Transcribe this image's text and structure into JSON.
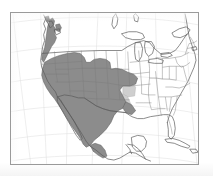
{
  "figure": {
    "background_color": "#ffffff",
    "frame": {
      "stroke_color": "#9a9a9a",
      "stroke_width_px": 1,
      "left_px": 10,
      "top_px": 12,
      "width_px": 189,
      "height_px": 153
    }
  },
  "legend_keys": [
    {
      "key": "primary-range",
      "label": "Primary range",
      "fill_color": "#8c8c8c",
      "stroke_color": "#5e5e5e"
    },
    {
      "key": "secondary-range",
      "label": "Secondary / marginal range",
      "fill_color": "#c9c9c9",
      "stroke_color": "#a8a8a8"
    },
    {
      "key": "outside-range",
      "label": "Outside range",
      "fill_color": "#ffffff",
      "stroke_color": "#6e6e6e"
    }
  ],
  "map_style": {
    "land_fill": "#ffffff",
    "coastline_stroke": "#5a5a5a",
    "coastline_width": 0.7,
    "state_border_stroke": "#7a7a7a",
    "state_border_width": 0.45,
    "country_border_stroke": "#5a5a5a",
    "country_border_width": 0.7,
    "graticule_stroke": "#dcdcdc",
    "graticule_width": 0.5,
    "range_primary_fill": "#8c8c8c",
    "range_primary_stroke": "#5e5e5e",
    "range_secondary_fill": "#cfcfcf",
    "range_secondary_stroke": "#b0b0b0",
    "ocean_fill": "#ffffff"
  },
  "graticule": {
    "visible": true,
    "meridian_count": 7,
    "parallel_count": 6,
    "note": "Faint curved conic-projection grid lines"
  },
  "regions": {
    "shaded_primary": [
      "British Columbia coast",
      "Washington",
      "Oregon",
      "California",
      "Idaho",
      "Nevada",
      "Utah",
      "Arizona",
      "New Mexico",
      "Colorado",
      "Wyoming",
      "Montana",
      "western Kansas",
      "Oklahoma",
      "Texas",
      "mainland Mexico"
    ],
    "shaded_secondary": [
      "eastern Kansas",
      "eastern Oklahoma",
      "western Arkansas",
      "southern Arizona border",
      "eastern Texas"
    ],
    "unshaded": [
      "Baja California",
      "Great Plains east",
      "Midwest",
      "Eastern United States",
      "Florida",
      "Great Lakes",
      "Canada interior",
      "Cuba",
      "Yucatan Peninsula",
      "Central America"
    ]
  }
}
